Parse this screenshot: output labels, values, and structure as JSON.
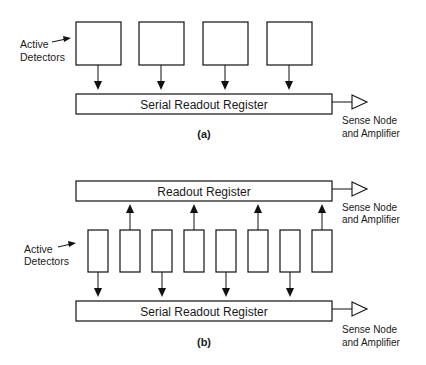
{
  "panel_a": {
    "label": "(a)",
    "active_detectors_label": [
      "Active",
      "Detectors"
    ],
    "register_label": "Serial Readout Register",
    "output_label": [
      "Sense Node",
      "and Amplifier"
    ],
    "detector_count": 4
  },
  "panel_b": {
    "label": "(b)",
    "active_detectors_label": [
      "Active",
      "Detectors"
    ],
    "top_register_label": "Readout Register",
    "bottom_register_label": "Serial Readout Register",
    "top_output_label": [
      "Sense Node",
      "and Amplifier"
    ],
    "bottom_output_label": [
      "Sense Node",
      "and Amplifier"
    ],
    "detector_count": 8
  }
}
